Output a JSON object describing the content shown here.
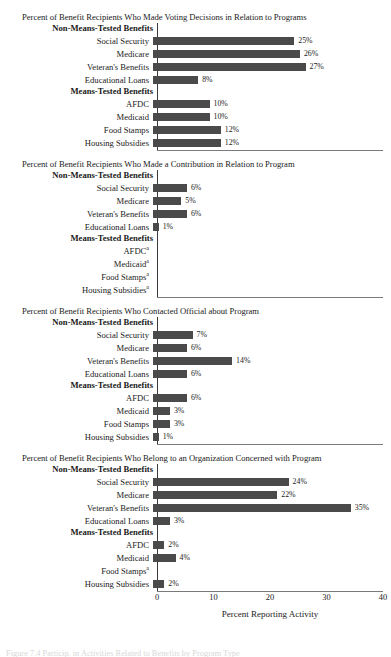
{
  "figure": {
    "axis_title": "Percent Reporting Activity",
    "tick_labels": [
      "0",
      "10",
      "20",
      "30",
      "40"
    ],
    "group_heading_non_means": "Non-Means-Tested Benefits",
    "group_heading_means": "Means-Tested Benefits",
    "bar_color": "#4a4a4a",
    "axis_color": "#3a3a3a",
    "caption": "Figure 7.4 Particip. in Activities Related to Benefits by Program Type"
  },
  "chart_data": [
    {
      "type": "bar",
      "title": "Percent of Benefit Recipients Who Made Voting Decisions in Relation to Programs",
      "xlabel": "Percent Reporting Activity",
      "ylabel": "",
      "xlim": [
        0,
        40
      ],
      "grid": false,
      "orientation": "horizontal",
      "groups": [
        {
          "heading": "Non-Means-Tested Benefits",
          "categories": [
            "Social Security",
            "Medicare",
            "Veteran's Benefits",
            "Educational Loans"
          ],
          "values": [
            25,
            26,
            27,
            8
          ],
          "labels": [
            "25%",
            "26%",
            "27%",
            "8%"
          ],
          "footnotes": [
            "",
            "",
            "",
            ""
          ]
        },
        {
          "heading": "Means-Tested Benefits",
          "categories": [
            "AFDC",
            "Medicaid",
            "Food Stamps",
            "Housing Subsidies"
          ],
          "values": [
            10,
            10,
            12,
            12
          ],
          "labels": [
            "10%",
            "10%",
            "12%",
            "12%"
          ],
          "footnotes": [
            "",
            "",
            "",
            ""
          ]
        }
      ]
    },
    {
      "type": "bar",
      "title": "Percent of Benefit Recipients Who Made a Contribution in Relation to Program",
      "xlabel": "Percent Reporting Activity",
      "ylabel": "",
      "xlim": [
        0,
        40
      ],
      "grid": false,
      "orientation": "horizontal",
      "groups": [
        {
          "heading": "Non-Means-Tested Benefits",
          "categories": [
            "Social Security",
            "Medicare",
            "Veteran's Benefits",
            "Educational Loans"
          ],
          "values": [
            6,
            5,
            6,
            1
          ],
          "labels": [
            "6%",
            "5%",
            "6%",
            "1%"
          ],
          "footnotes": [
            "",
            "",
            "",
            ""
          ]
        },
        {
          "heading": "Means-Tested Benefits",
          "categories": [
            "AFDC",
            "Medicaid",
            "Food Stamps",
            "Housing Subsidies"
          ],
          "values": [
            null,
            null,
            null,
            null
          ],
          "labels": [
            "",
            "",
            "",
            ""
          ],
          "footnotes": [
            "a",
            "a",
            "a",
            "a"
          ]
        }
      ]
    },
    {
      "type": "bar",
      "title": "Percent of Benefit Recipients Who Contacted Official about Program",
      "xlabel": "Percent Reporting Activity",
      "ylabel": "",
      "xlim": [
        0,
        40
      ],
      "grid": false,
      "orientation": "horizontal",
      "groups": [
        {
          "heading": "Non-Means-Tested Benefits",
          "categories": [
            "Social Security",
            "Medicare",
            "Veteran's Benefits",
            "Educational Loans"
          ],
          "values": [
            7,
            6,
            14,
            6
          ],
          "labels": [
            "7%",
            "6%",
            "14%",
            "6%"
          ],
          "footnotes": [
            "",
            "",
            "",
            ""
          ]
        },
        {
          "heading": "Means-Tested Benefits",
          "categories": [
            "AFDC",
            "Medicaid",
            "Food Stamps",
            "Housing Subsidies"
          ],
          "values": [
            6,
            3,
            3,
            1
          ],
          "labels": [
            "6%",
            "3%",
            "3%",
            "1%"
          ],
          "footnotes": [
            "",
            "",
            "",
            ""
          ]
        }
      ]
    },
    {
      "type": "bar",
      "title": "Percent of Benefit Recipients Who Belong to an Organization Concerned with Program",
      "xlabel": "Percent Reporting Activity",
      "ylabel": "",
      "xlim": [
        0,
        40
      ],
      "grid": false,
      "orientation": "horizontal",
      "groups": [
        {
          "heading": "Non-Means-Tested Benefits",
          "categories": [
            "Social Security",
            "Medicare",
            "Veteran's Benefits",
            "Educational Loans"
          ],
          "values": [
            24,
            22,
            35,
            3
          ],
          "labels": [
            "24%",
            "22%",
            "35%",
            "3%"
          ],
          "footnotes": [
            "",
            "",
            "",
            ""
          ]
        },
        {
          "heading": "Means-Tested Benefits",
          "categories": [
            "AFDC",
            "Medicaid",
            "Food Stamps",
            "Housing Subsidies"
          ],
          "values": [
            2,
            4,
            null,
            2
          ],
          "labels": [
            "2%",
            "4%",
            "",
            "2%"
          ],
          "footnotes": [
            "",
            "",
            "a",
            ""
          ]
        }
      ]
    }
  ]
}
